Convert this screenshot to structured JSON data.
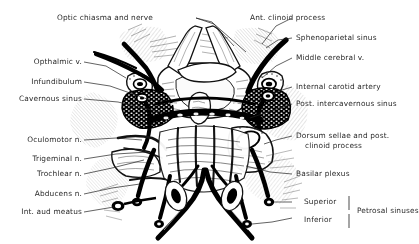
{
  "figure": {
    "style": "pen-and-ink anatomical line drawing",
    "ink_color": "#000000",
    "background_color": "#ffffff",
    "label_color": "#2a2a2a"
  },
  "labels": {
    "optic_chiasma": "Optic chiasma and nerve",
    "ant_clinoid": "Ant. clinoid process",
    "sphenoparietal": "Sphenoparietal sinus",
    "opthalmic_v": "Opthalmic v.",
    "middle_cerebral": "Middle cerebral v.",
    "infundibulum": "Infundibulum",
    "internal_carotid": "Internal carotid artery",
    "cavernous_sinus": "Cavernous sinus",
    "post_intercavernous": "Post. intercavernous sinus",
    "oculomotor": "Oculomotor n.",
    "dorsum_sellae_line1": "Dorsum sellae and post.",
    "dorsum_sellae_line2": "clinoid process",
    "trigeminal": "Trigeminal n.",
    "trochlear": "Trochlear n.",
    "basilar_plexus": "Basilar plexus",
    "abducens": "Abducens n.",
    "superior": "Superior",
    "inferior": "Inferior",
    "int_aud_meatus": "Int. aud meatus",
    "petrosal_sinuses": "Petrosal sinuses"
  }
}
